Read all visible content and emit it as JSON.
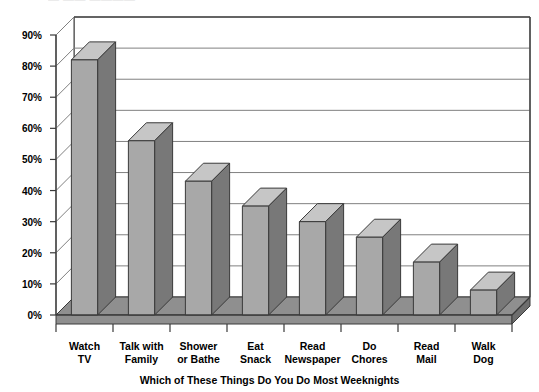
{
  "header": {
    "clipped_text": "— —— ————"
  },
  "chart_data": {
    "type": "bar",
    "title": "",
    "xlabel": "Which of These Things Do You Do Most Weeknights",
    "ylabel": "",
    "categories": [
      "Watch TV",
      "Talk with Family",
      "Shower or Bathe",
      "Eat Snack",
      "Read Newspaper",
      "Do Chores",
      "Read Mail",
      "Walk Dog"
    ],
    "category_lines": [
      [
        "Watch",
        "TV"
      ],
      [
        "Talk with",
        "Family"
      ],
      [
        "Shower",
        "or Bathe"
      ],
      [
        "Eat",
        "Snack"
      ],
      [
        "Read",
        "Newspaper"
      ],
      [
        "Do",
        "Chores"
      ],
      [
        "Read",
        "Mail"
      ],
      [
        "Walk",
        "Dog"
      ]
    ],
    "values": [
      82,
      56,
      43,
      35,
      30,
      25,
      17,
      8
    ],
    "ylim": [
      0,
      90
    ],
    "ytick_labels": [
      "90%",
      "80%",
      "70%",
      "60%",
      "50%",
      "40%",
      "30%",
      "20%",
      "10%",
      "0%"
    ],
    "ytick_values": [
      90,
      80,
      70,
      60,
      50,
      40,
      30,
      20,
      10,
      0
    ],
    "grid": true,
    "legend": "none",
    "style": "3d-column",
    "colors": {
      "bar_front": "#a8a8a8",
      "bar_top": "#c6c6c6",
      "bar_side": "#787878",
      "floor": "#8f8f8f",
      "wall": "#ffffff",
      "gridline": "#808080",
      "outline": "#3a3a3a",
      "text": "#000000"
    }
  }
}
